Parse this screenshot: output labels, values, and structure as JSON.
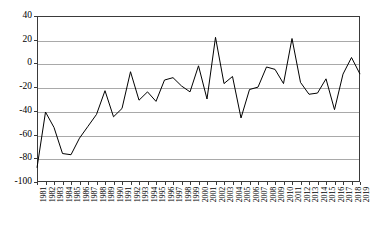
{
  "chart_data": {
    "type": "line",
    "title": "",
    "subtitle": "",
    "xlabel": "",
    "ylabel": "",
    "categories": [
      "1981",
      "1982",
      "1983",
      "1984",
      "1985",
      "1986",
      "1987",
      "1988",
      "1989",
      "1990",
      "1991",
      "1992",
      "1993",
      "1994",
      "1995",
      "1996",
      "1997",
      "1998",
      "1999",
      "2000",
      "2001",
      "2002",
      "2003",
      "2004",
      "2005",
      "2006",
      "2007",
      "2008",
      "2009",
      "2010",
      "2011",
      "2012",
      "2013",
      "2014",
      "2015",
      "2016",
      "2017",
      "2018",
      "2019"
    ],
    "values": [
      -88,
      -41,
      -54,
      -76,
      -77,
      -63,
      -53,
      -43,
      -23,
      -45,
      -38,
      -7,
      -31,
      -24,
      -32,
      -14,
      -12,
      -19,
      -24,
      -2,
      -30,
      22,
      -17,
      -11,
      -46,
      -22,
      -20,
      -3,
      -5,
      -17,
      21,
      -16,
      -26,
      -25,
      -13,
      -39,
      -9,
      5,
      -9
    ],
    "series": [
      {
        "name": "series-1",
        "values": [
          -88,
          -41,
          -54,
          -76,
          -77,
          -63,
          -53,
          -43,
          -23,
          -45,
          -38,
          -7,
          -31,
          -24,
          -32,
          -14,
          -12,
          -19,
          -24,
          -2,
          -30,
          22,
          -17,
          -11,
          -46,
          -22,
          -20,
          -3,
          -5,
          -17,
          21,
          -16,
          -26,
          -25,
          -13,
          -39,
          -9,
          5,
          -9
        ]
      }
    ],
    "ylim": [
      -100,
      40
    ],
    "yticks": [
      40,
      20,
      0,
      -20,
      -40,
      -60,
      -80,
      -100
    ],
    "ytick_labels": [
      "40",
      "20",
      "0",
      "-20",
      "-40",
      "-60",
      "-80",
      "-100"
    ],
    "xlim": [
      "1981",
      "2019"
    ],
    "grid": true,
    "grid_axis": "y",
    "legend": false,
    "legend_position": "none",
    "line_color": "#000000",
    "grid_color": "#a9a9a9",
    "frame_color": "#3a3a3a",
    "background_color": "#ffffff",
    "markers": false,
    "xtick_rotation": -90,
    "annotations": []
  }
}
